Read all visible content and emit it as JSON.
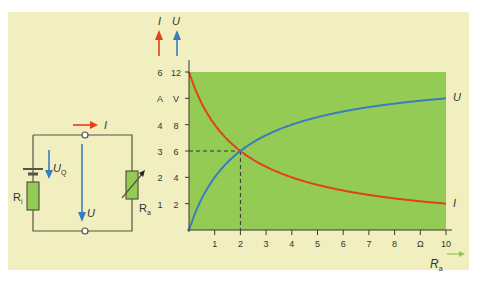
{
  "colors": {
    "panel_bg": "#f1efbf",
    "plot_bg": "#93cb55",
    "current": "#e2401f",
    "voltage": "#3a7dbd",
    "axis": "#3a3a2a",
    "resistor_fill": "#93cb55",
    "wire": "#555544",
    "ra_arrow": "#9cc24f"
  },
  "circuit": {
    "current_label": "I",
    "source_voltage_label": "U",
    "source_voltage_sub": "Q",
    "terminal_voltage_label": "U",
    "internal_resistor_label": "R",
    "internal_resistor_sub": "i",
    "load_resistor_label": "R",
    "load_resistor_sub": "a"
  },
  "chart_data": {
    "type": "line",
    "title": "",
    "xlabel": "R_a",
    "xunit": "Ω",
    "x_ticks": [
      "1",
      "2",
      "3",
      "4",
      "5",
      "6",
      "7",
      "8",
      "Ω",
      "10"
    ],
    "xlim": [
      0,
      10
    ],
    "y_axes": [
      {
        "name": "I",
        "unit": "A",
        "ticks": [
          "1",
          "2",
          "3",
          "4",
          "A",
          "6"
        ],
        "lim": [
          0,
          6
        ],
        "color": "#e2401f"
      },
      {
        "name": "U",
        "unit": "V",
        "ticks": [
          "2",
          "4",
          "6",
          "8",
          "V",
          "12"
        ],
        "lim": [
          0,
          12
        ],
        "color": "#3a7dbd"
      }
    ],
    "series": [
      {
        "name": "I",
        "axis": "A",
        "x": [
          0,
          0.5,
          1,
          1.5,
          2,
          3,
          4,
          5,
          6,
          7,
          8,
          9,
          10
        ],
        "values": [
          6,
          4.8,
          4,
          3.43,
          3,
          2.4,
          2,
          1.71,
          1.5,
          1.33,
          1.2,
          1.09,
          1
        ]
      },
      {
        "name": "U",
        "axis": "V",
        "x": [
          0,
          0.5,
          1,
          1.5,
          2,
          3,
          4,
          5,
          6,
          7,
          8,
          9,
          10
        ],
        "values": [
          0,
          2.4,
          4,
          5.14,
          6,
          7.2,
          8,
          8.57,
          9,
          9.33,
          9.6,
          9.82,
          10
        ]
      }
    ],
    "annotations": [
      {
        "type": "dashed-guide",
        "x": 2,
        "I": 3,
        "U": 6,
        "note": "intersection where R_a = R_i"
      }
    ],
    "grid": false,
    "legend": "curve-end labels (U, I)"
  },
  "labels": {
    "y_axis_I": "I",
    "y_axis_U": "U",
    "curve_U": "U",
    "curve_I": "I",
    "x_axis": "R",
    "x_axis_sub": "a"
  }
}
